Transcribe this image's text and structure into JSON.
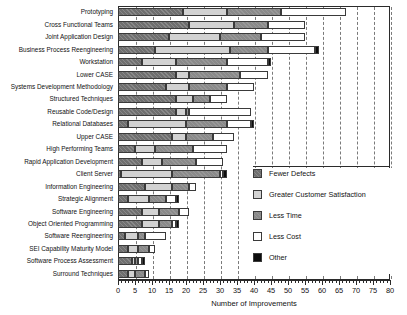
{
  "chart_data": {
    "type": "bar",
    "orientation": "horizontal",
    "stacked": true,
    "title": "",
    "xlabel": "Number of Improvements",
    "ylabel": "",
    "xlim": [
      0,
      80
    ],
    "xticks": [
      0,
      5,
      10,
      15,
      20,
      25,
      30,
      35,
      40,
      45,
      50,
      55,
      60,
      65,
      70,
      75,
      80
    ],
    "minor_tick_step": 1,
    "grid": "vertical-dashed",
    "legend_position": "right-inside",
    "categories": [
      "Prototyping",
      "Cross Functional Teams",
      "Joint Application Design",
      "Business Process Reengineering",
      "Workstation",
      "Lower CASE",
      "Systems Development Methodology",
      "Structured Techniques",
      "Reusable Code/Design",
      "Relational Databases",
      "Upper CASE",
      "High Performing Teams",
      "Rapid Application Development",
      "Client Server",
      "Information Engineering",
      "Strategic Alignment",
      "Software Engineering",
      "Object Oriented Programming",
      "Software Reengineering",
      "SEI Capability Maturity Model",
      "Software Process Assessment",
      "Surround Techniques"
    ],
    "series": [
      {
        "name": "Fewer Defects",
        "color": "#6f6f6f",
        "values": [
          19,
          21,
          15,
          11,
          7,
          17,
          14,
          17,
          17,
          3,
          16,
          5,
          7,
          1,
          8,
          3,
          7,
          7,
          2,
          3,
          4,
          3
        ]
      },
      {
        "name": "Greater Customer Satisfaction",
        "color": "#d2d2d2",
        "values": [
          13,
          13,
          15,
          22,
          10,
          4,
          7,
          5,
          3,
          17,
          4,
          6,
          6,
          15,
          8,
          6,
          5,
          5,
          4,
          3,
          1,
          2
        ]
      },
      {
        "name": "Less Time",
        "color": "#8a8a8a",
        "values": [
          16,
          10,
          12,
          11,
          15,
          15,
          11,
          5,
          1,
          12,
          8,
          11,
          10,
          14,
          5,
          5,
          6,
          4,
          2,
          3,
          1,
          3
        ]
      },
      {
        "name": "Less Cost",
        "color": "#ffffff",
        "values": [
          19,
          11,
          13,
          14,
          12,
          8,
          8,
          5,
          18,
          7,
          6,
          10,
          8,
          1,
          2,
          3,
          3,
          1,
          6,
          2,
          1,
          1
        ]
      },
      {
        "name": "Other",
        "color": "#0c0c0c",
        "values": [
          0,
          0,
          0,
          1,
          1,
          0,
          0,
          0,
          0,
          1,
          0,
          0,
          0,
          1,
          0,
          1,
          0,
          1,
          0,
          0,
          1,
          0
        ]
      }
    ],
    "totals": [
      67,
      55,
      55,
      59,
      45,
      44,
      40,
      32,
      39,
      40,
      34,
      32,
      31,
      32,
      23,
      18,
      21,
      18,
      14,
      11,
      8,
      9
    ]
  },
  "legend": {
    "items": [
      {
        "label": "Fewer Defects"
      },
      {
        "label": "Greater Customer Satisfaction"
      },
      {
        "label": "Less Time"
      },
      {
        "label": "Less Cost"
      },
      {
        "label": "Other"
      }
    ]
  }
}
